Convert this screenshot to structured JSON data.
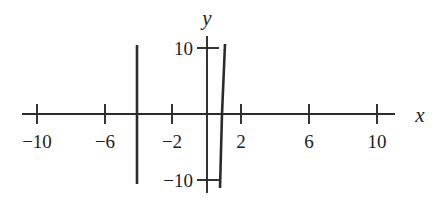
{
  "chart_data": {
    "type": "line",
    "title": "",
    "xlabel": "x",
    "ylabel": "y",
    "xlim": [
      -12,
      11
    ],
    "ylim": [
      -12,
      12
    ],
    "grid": false,
    "legend": null,
    "x_ticks": [
      {
        "value": -10,
        "label": "−10",
        "px": 37
      },
      {
        "value": -6,
        "label": "−6",
        "px": 105
      },
      {
        "value": -2,
        "label": "−2",
        "px": 172
      },
      {
        "value": 2,
        "label": "2",
        "px": 241
      },
      {
        "value": 6,
        "label": "6",
        "px": 309
      },
      {
        "value": 10,
        "label": "10",
        "px": 377
      }
    ],
    "y_ticks": [
      {
        "value": 10,
        "label": "10",
        "px": 48
      },
      {
        "value": -10,
        "label": "−10",
        "px": 180
      }
    ],
    "origin_px": {
      "x": 207,
      "y": 114
    },
    "px_per_unit_x": 17.0,
    "px_per_unit_y": 6.6,
    "x_axis_extent_px": [
      22,
      395
    ],
    "y_axis_extent_px": [
      36,
      193
    ],
    "series": [
      {
        "name": "left-branch",
        "description": "near-vertical branch at x = -4",
        "points": [
          [
            -4.12,
            10.5
          ],
          [
            -4.12,
            -10.6
          ]
        ],
        "px_points": [
          [
            137,
            45
          ],
          [
            137,
            184
          ]
        ]
      },
      {
        "name": "right-branch",
        "description": "steep near-vertical branch crossing the x-axis near x = 0.9",
        "points": [
          [
            1.06,
            10.6
          ],
          [
            0.88,
            0
          ],
          [
            0.76,
            -11.2
          ]
        ],
        "px_points": [
          [
            225,
            44
          ],
          [
            222,
            114
          ],
          [
            220,
            188
          ]
        ]
      }
    ],
    "annotations": []
  },
  "axis_labels": {
    "x": "x",
    "y": "y"
  }
}
